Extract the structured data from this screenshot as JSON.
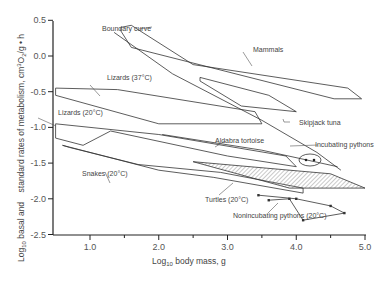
{
  "chart_data": {
    "type": "line",
    "title": "",
    "xlabel": "Log10 body mass, g",
    "xlabel_main": "Log",
    "xlabel_sub": "10",
    "xlabel_rest": " body mass, g",
    "ylabel": "Log10 basal and standard rates of metabolism, cm3O2/g • h",
    "ylabel_part1": "Log",
    "ylabel_sub1": "10",
    "ylabel_part2": " basal and    standard rates of metabolism, cm",
    "ylabel_sup": "3",
    "ylabel_part3": "O",
    "ylabel_sub2": "2",
    "ylabel_part4": "/g • h",
    "xlim": [
      0.5,
      5.0
    ],
    "ylim": [
      -2.5,
      0.5
    ],
    "x_ticks": [
      "1.0",
      "2.0",
      "3.0",
      "4.0",
      "5.0"
    ],
    "y_ticks": [
      "0.5",
      "0.0",
      "-0.5",
      "-1.0",
      "-1.5",
      "-2.0",
      "-2.5"
    ],
    "grid": false,
    "series": [
      {
        "name": "Mammals",
        "kind": "polygon",
        "points": [
          [
            1.45,
            0.4
          ],
          [
            1.6,
            0.43
          ],
          [
            2.5,
            -0.12
          ],
          [
            4.75,
            -0.45
          ],
          [
            4.95,
            -0.6
          ],
          [
            4.55,
            -0.6
          ],
          [
            1.6,
            0.12
          ],
          [
            1.45,
            0.35
          ]
        ]
      },
      {
        "name": "Boundary curve",
        "kind": "line",
        "points": [
          [
            1.35,
            0.33
          ],
          [
            2.2,
            -0.25
          ],
          [
            3.5,
            -0.9
          ],
          [
            4.3,
            -1.35
          ],
          [
            4.65,
            -1.6
          ]
        ]
      },
      {
        "name": "Lizards (37°C)",
        "kind": "polygon",
        "points": [
          [
            0.5,
            -0.45
          ],
          [
            1.4,
            -0.47
          ],
          [
            3.4,
            -0.78
          ],
          [
            3.5,
            -0.95
          ],
          [
            2.0,
            -0.95
          ],
          [
            0.5,
            -0.55
          ]
        ]
      },
      {
        "name": "Lizards (20°C)",
        "kind": "polygon",
        "points": [
          [
            0.5,
            -0.95
          ],
          [
            2.0,
            -1.1
          ],
          [
            3.85,
            -1.4
          ],
          [
            4.0,
            -1.55
          ],
          [
            3.0,
            -1.4
          ],
          [
            1.3,
            -1.05
          ],
          [
            0.9,
            -1.25
          ],
          [
            0.5,
            -1.15
          ]
        ]
      },
      {
        "name": "Skipjack tuna",
        "kind": "polygon",
        "points": [
          [
            2.6,
            -0.3
          ],
          [
            3.6,
            -0.55
          ],
          [
            4.0,
            -0.78
          ],
          [
            3.2,
            -0.7
          ],
          [
            2.6,
            -0.35
          ]
        ]
      },
      {
        "name": "Aldabra tortoise",
        "kind": "line",
        "points": [
          [
            2.05,
            -1.1
          ],
          [
            3.5,
            -1.32
          ],
          [
            4.6,
            -1.55
          ]
        ]
      },
      {
        "name": "Snakes (20°C)",
        "kind": "polygon",
        "points": [
          [
            0.6,
            -1.25
          ],
          [
            2.0,
            -1.6
          ],
          [
            2.8,
            -1.7
          ],
          [
            4.1,
            -1.92
          ],
          [
            4.1,
            -1.85
          ],
          [
            2.9,
            -1.63
          ],
          [
            1.7,
            -1.52
          ],
          [
            0.7,
            -1.28
          ]
        ]
      },
      {
        "name": "Turtles (20°C)",
        "kind": "hatched-polygon",
        "points": [
          [
            2.5,
            -1.48
          ],
          [
            4.5,
            -1.65
          ],
          [
            5.0,
            -1.85
          ],
          [
            3.9,
            -1.85
          ],
          [
            2.5,
            -1.48
          ]
        ]
      },
      {
        "name": "Incubating pythons",
        "kind": "points",
        "points": [
          [
            4.2,
            -1.55
          ],
          [
            4.4,
            -1.55
          ]
        ]
      },
      {
        "name": "Nonincubating pythons (20°C)",
        "kind": "polyline-points",
        "points": [
          [
            3.45,
            -1.95
          ],
          [
            4.0,
            -2.0
          ],
          [
            4.5,
            -2.1
          ],
          [
            4.7,
            -2.2
          ],
          [
            4.1,
            -2.3
          ],
          [
            3.9,
            -2.0
          ],
          [
            3.6,
            -2.02
          ]
        ]
      }
    ],
    "annotations": [
      "Boundary curve",
      "Mammals",
      "Lizards (37°C)",
      "Lizards (20°C)",
      "Skipjack tuna",
      "Aldabra tortoise",
      "Incubating pythons",
      "Snakes (20°C)",
      "Turtles (20°C)",
      "Nonincubating pythons (20°C)"
    ]
  },
  "labels": {
    "boundary": "Boundary curve",
    "mammals": "Mammals",
    "lizards37": "Lizards (37°C)",
    "lizards20": "Lizards (20°C)",
    "skipjack": "Skipjack tuna",
    "aldabra": "Aldabra tortoise",
    "incubating": "Incubating pythons",
    "snakes": "Snakes (20°C)",
    "turtles": "Turtles (20°C)",
    "nonincubating": "Nonincubating pythons (20°C)"
  }
}
